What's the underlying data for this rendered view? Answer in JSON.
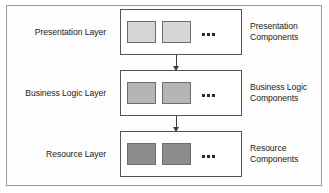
{
  "diagram": {
    "frame_border_color": "#9a9a9a",
    "layer_border_color": "#555555",
    "arrow_color": "#3d3d3d",
    "layers": [
      {
        "name": "presentation-layer",
        "layer_label": "Presentation Layer",
        "component_label_line1": "Presentation",
        "component_label_line2": "Components",
        "component_fill": "#d6d6d6",
        "component_count": 2,
        "ellipsis": "..."
      },
      {
        "name": "business-logic-layer",
        "layer_label": "Business Logic Layer",
        "component_label_line1": "Business Logic",
        "component_label_line2": "Components",
        "component_fill": "#b5b5b5",
        "component_count": 2,
        "ellipsis": "..."
      },
      {
        "name": "resource-layer",
        "layer_label": "Resource Layer",
        "component_label_line1": "Resource",
        "component_label_line2": "Components",
        "component_fill": "#8c8c8c",
        "component_count": 2,
        "ellipsis": "..."
      }
    ],
    "arrows": [
      {
        "name": "arrow-presentation-to-business",
        "direction": "down"
      },
      {
        "name": "arrow-business-to-resource",
        "direction": "down"
      }
    ]
  }
}
